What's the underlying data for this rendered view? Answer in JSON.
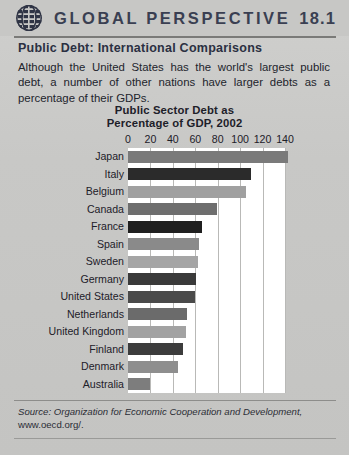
{
  "header": {
    "logo_icon": "globe-grid-icon",
    "title": "GLOBAL PERSPECTIVE",
    "number": "18.1"
  },
  "subtitle": "Public Debt: International Comparisons",
  "intro": "Although the United States has the world's largest public debt, a number of other nations have larger debts as a percentage of their GDPs.",
  "source": {
    "prefix": "Source: Organization for Economic Cooperation and Development,",
    "url": "www.oecd.org/."
  },
  "chart_data": {
    "type": "bar",
    "orientation": "horizontal",
    "title": "Public Sector Debt as\nPercentage of GDP, 2002",
    "title_line1": "Public Sector Debt as",
    "title_line2": "Percentage of GDP, 2002",
    "xlabel": "",
    "ylabel": "",
    "xlim": [
      0,
      140
    ],
    "ticks": [
      0,
      20,
      40,
      60,
      80,
      100,
      120,
      140
    ],
    "grid": true,
    "legend": "none",
    "categories": [
      "Japan",
      "Italy",
      "Belgium",
      "Canada",
      "France",
      "Spain",
      "Sweden",
      "Germany",
      "United States",
      "Netherlands",
      "United Kingdom",
      "Finland",
      "Denmark",
      "Australia"
    ],
    "values": [
      143,
      110,
      105,
      79,
      66,
      63,
      62,
      61,
      60,
      53,
      52,
      49,
      45,
      20
    ],
    "bar_colors": [
      "#7a7a7a",
      "#2b2b2b",
      "#a0a0a0",
      "#6e6e6e",
      "#1f1f1f",
      "#8a8a8a",
      "#a5a5a5",
      "#3a3a3a",
      "#4a4a4a",
      "#6b6b6b",
      "#a2a2a2",
      "#3c3c3c",
      "#8e8e8e",
      "#7d7d7d"
    ]
  }
}
